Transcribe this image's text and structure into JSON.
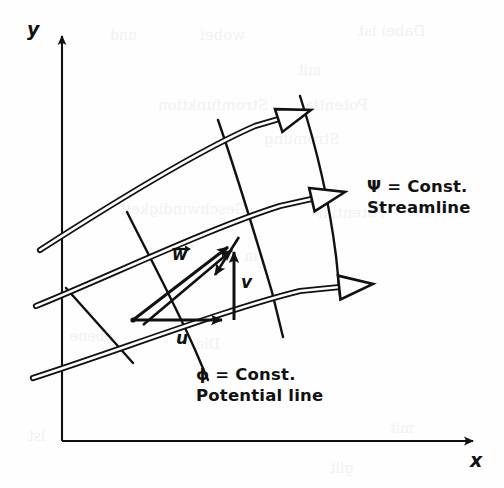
{
  "figure": {
    "background_color": "#fefefe",
    "ink_color": "#111111",
    "ghost_color": "#f2f1ef"
  },
  "axes": {
    "y_label": "y",
    "x_label": "x",
    "y_axis": {
      "x": 62,
      "y_top": 30,
      "y_bottom": 441
    },
    "x_axis": {
      "y": 441,
      "x_left": 62,
      "x_right": 481
    }
  },
  "annotations": [
    {
      "name": "streamline-annotation",
      "line1": "Ψ = Const.",
      "line2": "Streamline",
      "x": 367,
      "y": 176
    },
    {
      "name": "potential-line-annotation",
      "line1": "ϕ = Const.",
      "line2": "Potential line",
      "x": 196,
      "y": 364
    }
  ],
  "velocity_vectors": [
    {
      "name": "resultant-velocity",
      "label": "w",
      "has_arrow_overbar": true,
      "x": 172,
      "y": 244
    },
    {
      "name": "vertical-velocity-component",
      "label": "v",
      "has_arrow_overbar": false,
      "x": 241,
      "y": 272
    },
    {
      "name": "horizontal-velocity-component",
      "label": "u",
      "has_arrow_overbar": false,
      "x": 176,
      "y": 328
    }
  ],
  "velocity_triangle": {
    "origin": {
      "x": 133,
      "y": 320
    },
    "u_tip": {
      "x": 234,
      "y": 320
    },
    "v_tip": {
      "x": 234,
      "y": 241
    },
    "w_tip": {
      "x": 238,
      "y": 239
    }
  },
  "streamlines": [
    {
      "name": "streamline-upper",
      "path": "M 40,250 C 110,205 200,150 255,126 L 296,114",
      "arrow_tip": {
        "x": 311,
        "y": 110
      },
      "arrow_angle": -18
    },
    {
      "name": "streamline-middle",
      "path": "M 36,306 C 110,276 210,228 280,206 L 325,196",
      "arrow_tip": {
        "x": 345,
        "y": 192
      },
      "arrow_angle": -13
    },
    {
      "name": "streamline-lower",
      "path": "M 33,378 C 120,350 230,308 300,291 L 350,286",
      "arrow_tip": {
        "x": 373,
        "y": 284
      },
      "arrow_angle": -6
    }
  ],
  "potential_lines": [
    {
      "name": "potential-line-left",
      "path": "M 66,288 L 133,363"
    },
    {
      "name": "potential-line-center",
      "path": "M 127,212 C 152,262 176,306 196,352 L 208,380"
    },
    {
      "name": "potential-line-right",
      "path": "M 218,120 C 238,178 256,238 272,292 L 283,337"
    },
    {
      "name": "potential-line-far-right",
      "path": "M 300,96 C 318,152 330,208 336,256 L 340,295"
    }
  ],
  "ghost_text": [
    {
      "text": "Dabei ist",
      "x": 358,
      "y": 22,
      "size": 15
    },
    {
      "text": "wobei",
      "x": 200,
      "y": 26,
      "size": 15
    },
    {
      "text": "und",
      "x": 110,
      "y": 27,
      "size": 14
    },
    {
      "text": "mit",
      "x": 298,
      "y": 62,
      "size": 14
    },
    {
      "text": "Potential",
      "x": 300,
      "y": 96,
      "size": 15
    },
    {
      "text": "Stromfunktion",
      "x": 158,
      "y": 96,
      "size": 15
    },
    {
      "text": "Strömung",
      "x": 264,
      "y": 130,
      "size": 15
    },
    {
      "text": "Geschwindigkeit",
      "x": 120,
      "y": 200,
      "size": 15
    },
    {
      "text": "Potential",
      "x": 318,
      "y": 204,
      "size": 15
    },
    {
      "text": "in der",
      "x": 216,
      "y": 248,
      "size": 14
    },
    {
      "text": "ebene",
      "x": 70,
      "y": 328,
      "size": 14
    },
    {
      "text": "Die",
      "x": 196,
      "y": 336,
      "size": 14
    },
    {
      "text": "mit",
      "x": 390,
      "y": 420,
      "size": 14
    },
    {
      "text": "ist",
      "x": 28,
      "y": 428,
      "size": 14
    },
    {
      "text": "gilt",
      "x": 330,
      "y": 460,
      "size": 14
    }
  ]
}
